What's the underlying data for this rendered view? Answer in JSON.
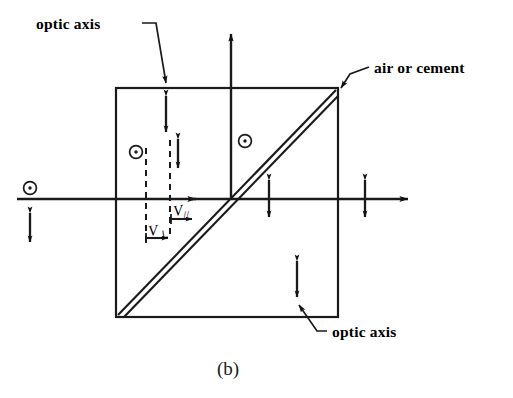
{
  "figure": {
    "caption": "(b)",
    "title_labels": {
      "optic_axis_top": "optic axis",
      "air_or_cement": "air or cement",
      "optic_axis_bottom": "optic axis"
    },
    "velocity_labels": {
      "v_perp": "V",
      "v_perp_sub": "⊥",
      "v_par": "V",
      "v_par_sub": "//"
    },
    "colors": {
      "ink": "#1a1a1a",
      "stroke": "#000000",
      "background": "#ffffff"
    },
    "geometry": {
      "prism": {
        "x": 116,
        "y": 88,
        "width": 222,
        "height": 229
      },
      "horizontal_ray_y": 199,
      "vertical_ray_x": 231,
      "dashed_line_1_x": 146,
      "dashed_line_2_x": 170
    },
    "symbols": {
      "circle_dot_name": "circle-dot-polarization-symbol",
      "double_arrow_name": "double-headed-arrow-polarization-symbol",
      "circle_dot_count": 3,
      "double_arrow_count": 6
    }
  }
}
